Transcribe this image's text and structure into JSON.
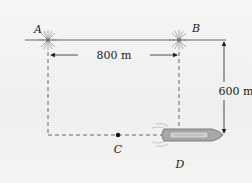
{
  "diagram": {
    "points": {
      "A": {
        "label": "A"
      },
      "B": {
        "label": "B"
      },
      "C": {
        "label": "C"
      },
      "D": {
        "label": "D"
      }
    },
    "dimensions": {
      "horizontal": {
        "label": "800 m"
      },
      "vertical": {
        "label": "600 m"
      }
    },
    "colors": {
      "line": "#555555",
      "dashed": "#666666",
      "text": "#222222",
      "boat_hull": "#888888"
    }
  }
}
